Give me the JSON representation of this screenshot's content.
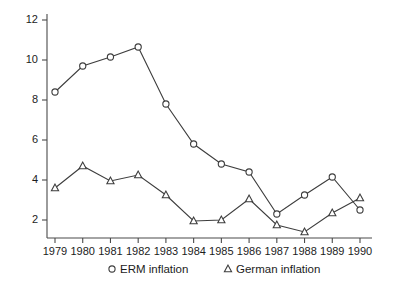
{
  "chart_data": {
    "type": "line",
    "title": "",
    "subtitle": "",
    "xlabel": "",
    "ylabel": "",
    "categories": [
      "1979",
      "1980",
      "1981",
      "1982",
      "1983",
      "1984",
      "1985",
      "1986",
      "1987",
      "1988",
      "1989",
      "1990"
    ],
    "x": [
      1979,
      1980,
      1981,
      1982,
      1983,
      1984,
      1985,
      1986,
      1987,
      1988,
      1989,
      1990
    ],
    "xlim": [
      1979,
      1990
    ],
    "ylim": [
      1.0,
      12.6
    ],
    "yticks": [
      2,
      4,
      6,
      8,
      10,
      12
    ],
    "ytick_labels": [
      "2",
      "4",
      "6",
      "8",
      "10",
      "12"
    ],
    "xtick_labels": [
      "1979",
      "1980",
      "1981",
      "1982",
      "1983",
      "1984",
      "1985",
      "1986",
      "1987",
      "1988",
      "1989",
      "1990"
    ],
    "grid": false,
    "legend_position": "bottom",
    "series": [
      {
        "name": "ERM inflation",
        "marker": "circle",
        "color": "#3d3d3d",
        "values": [
          8.4,
          9.7,
          10.15,
          10.65,
          7.8,
          5.8,
          4.8,
          4.4,
          2.3,
          3.25,
          4.15,
          2.5
        ]
      },
      {
        "name": "German inflation",
        "marker": "triangle",
        "color": "#3d3d3d",
        "values": [
          3.6,
          4.7,
          3.95,
          4.25,
          3.25,
          1.95,
          2.0,
          3.05,
          1.75,
          1.4,
          2.35,
          3.1
        ]
      }
    ],
    "legend": [
      {
        "marker": "circle",
        "label": "ERM inflation"
      },
      {
        "marker": "triangle",
        "label": "German inflation"
      }
    ]
  }
}
